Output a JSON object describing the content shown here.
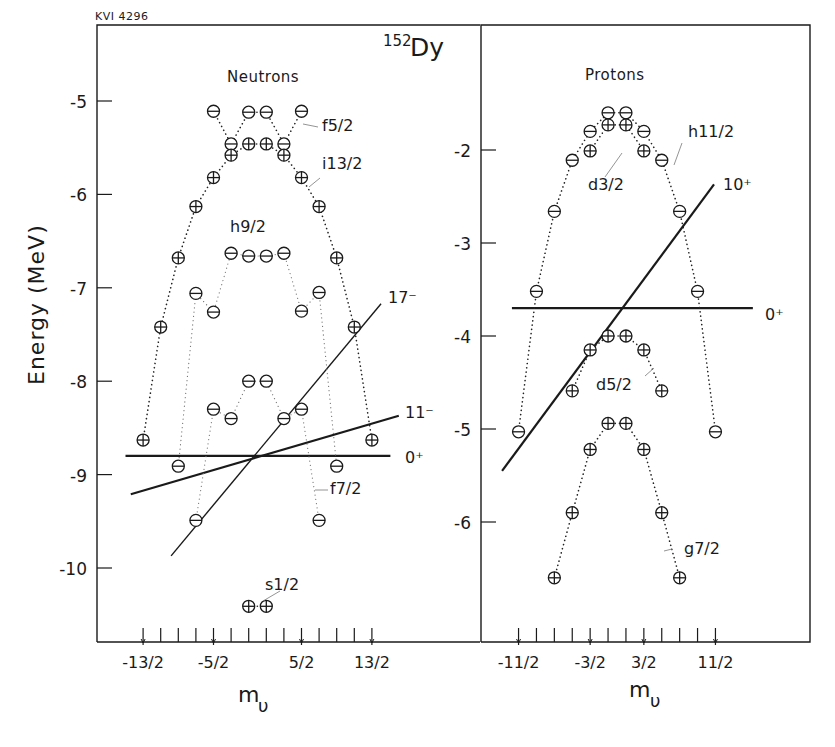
{
  "figure_id": "KVI 4296",
  "nucleus": {
    "mass_number": "152",
    "symbol": "Dy"
  },
  "chart_data": [
    {
      "type": "scatter",
      "title": "Neutrons",
      "xlabel": "m_ν",
      "ylabel": "Energy (MeV)",
      "ylim": [
        -10.8,
        -4.6
      ],
      "xlim": [
        -9,
        9
      ],
      "yticks": [
        -5,
        -6,
        -7,
        -8,
        -9,
        -10
      ],
      "ytick_labels": [
        "-5",
        "-6",
        "-7",
        "-8",
        "-9",
        "-10"
      ],
      "xticks": [
        -6.5,
        -5.5,
        -4.5,
        -3.5,
        -2.5,
        -1.5,
        -0.5,
        0.5,
        1.5,
        2.5,
        3.5,
        4.5,
        5.5,
        6.5
      ],
      "xtick_labels": [
        {
          "x": -6.5,
          "label": "-13/2"
        },
        {
          "x": -2.5,
          "label": "-5/2"
        },
        {
          "x": 2.5,
          "label": "5/2"
        },
        {
          "x": 6.5,
          "label": "13/2"
        }
      ],
      "major_xticks": [
        -6.5,
        -2.5,
        2.5,
        6.5
      ],
      "marker_legend": {
        "plus": "positive parity (⊕)",
        "minus": "negative parity (⊖)"
      },
      "series": [
        {
          "name": "f5/2",
          "parity": "minus",
          "label": "f5/2",
          "points": [
            [
              -2.5,
              -5.11
            ],
            [
              -1.5,
              -5.46
            ],
            [
              -0.5,
              -5.12
            ],
            [
              0.5,
              -5.12
            ],
            [
              1.5,
              -5.46
            ],
            [
              2.5,
              -5.11
            ]
          ],
          "line_order": [
            [
              -2.5,
              -5.11
            ],
            [
              -1.5,
              -5.46
            ],
            [
              -0.5,
              -5.12
            ]
          ],
          "line_order2": [
            [
              0.5,
              -5.12
            ],
            [
              1.5,
              -5.46
            ],
            [
              2.5,
              -5.11
            ]
          ]
        },
        {
          "name": "i13/2",
          "parity": "plus",
          "label": "i13/2",
          "points": [
            [
              -6.5,
              -8.63
            ],
            [
              -5.5,
              -7.42
            ],
            [
              -4.5,
              -6.68
            ],
            [
              -3.5,
              -6.13
            ],
            [
              -2.5,
              -5.82
            ],
            [
              -1.5,
              -5.58
            ],
            [
              -0.5,
              -5.46
            ],
            [
              0.5,
              -5.46
            ],
            [
              1.5,
              -5.58
            ],
            [
              2.5,
              -5.82
            ],
            [
              3.5,
              -6.13
            ],
            [
              4.5,
              -6.68
            ],
            [
              5.5,
              -7.42
            ],
            [
              6.5,
              -8.63
            ]
          ]
        },
        {
          "name": "h9/2",
          "parity": "minus",
          "label": "h9/2",
          "points": [
            [
              -4.5,
              -8.91
            ],
            [
              -3.5,
              -7.06
            ],
            [
              -2.5,
              -7.26
            ],
            [
              -1.5,
              -6.63
            ],
            [
              -0.5,
              -6.66
            ],
            [
              0.5,
              -6.66
            ],
            [
              1.5,
              -6.63
            ],
            [
              2.5,
              -7.25
            ],
            [
              3.5,
              -7.05
            ],
            [
              4.5,
              -8.91
            ]
          ]
        },
        {
          "name": "f7/2",
          "parity": "minus",
          "label": "f7/2",
          "points": [
            [
              -3.5,
              -9.49
            ],
            [
              -2.5,
              -8.3
            ],
            [
              -1.5,
              -8.4
            ],
            [
              -0.5,
              -8.0
            ],
            [
              0.5,
              -8.0
            ],
            [
              1.5,
              -8.4
            ],
            [
              2.5,
              -8.3
            ],
            [
              3.5,
              -9.49
            ]
          ]
        },
        {
          "name": "s1/2",
          "parity": "plus",
          "label": "s1/2",
          "points": [
            [
              -0.5,
              -10.41
            ],
            [
              0.5,
              -10.41
            ]
          ]
        }
      ],
      "bands": [
        {
          "label": "0⁺",
          "from": [
            -7.5,
            -8.8
          ],
          "to": [
            7.55,
            -8.8
          ],
          "weight": "heavy"
        },
        {
          "label": "11⁻",
          "from": [
            -7.2,
            -9.21
          ],
          "to": [
            8.03,
            -8.37
          ],
          "weight": "heavy"
        },
        {
          "label": "17⁻",
          "from": [
            -4.91,
            -9.87
          ],
          "to": [
            7.02,
            -7.17
          ],
          "weight": "thin"
        }
      ]
    },
    {
      "type": "scatter",
      "title": "Protons",
      "xlabel": "m_ν",
      "ylabel": "Energy (MeV)",
      "ylim": [
        -6.9,
        -1.2
      ],
      "xlim": [
        -7.5,
        10.5
      ],
      "yticks": [
        -2,
        -3,
        -4,
        -5,
        -6
      ],
      "ytick_labels": [
        "-2",
        "-3",
        "-4",
        "-5",
        "-6"
      ],
      "xticks": [
        -5.5,
        -4.5,
        -3.5,
        -2.5,
        -1.5,
        -0.5,
        0.5,
        1.5,
        2.5,
        3.5,
        4.5,
        5.5
      ],
      "xtick_labels": [
        {
          "x": -5.5,
          "label": "-11/2"
        },
        {
          "x": -1.5,
          "label": "-3/2"
        },
        {
          "x": 1.5,
          "label": "3/2"
        },
        {
          "x": 5.5,
          "label": "11/2"
        }
      ],
      "major_xticks": [
        -5.5,
        -1.5,
        1.5,
        5.5
      ],
      "series": [
        {
          "name": "h11/2",
          "parity": "minus",
          "label": "h11/2",
          "points": [
            [
              -5.5,
              -5.03
            ],
            [
              -4.5,
              -3.52
            ],
            [
              -3.5,
              -2.66
            ],
            [
              -2.5,
              -2.11
            ],
            [
              -1.5,
              -1.8
            ],
            [
              -0.5,
              -1.6
            ],
            [
              0.5,
              -1.6
            ],
            [
              1.5,
              -1.8
            ],
            [
              2.5,
              -2.11
            ],
            [
              3.5,
              -2.66
            ],
            [
              4.5,
              -3.52
            ],
            [
              5.5,
              -5.03
            ]
          ]
        },
        {
          "name": "d3/2",
          "parity": "plus",
          "label": "d3/2",
          "points": [
            [
              -1.5,
              -2.01
            ],
            [
              -0.5,
              -1.73
            ],
            [
              0.5,
              -1.73
            ],
            [
              1.5,
              -2.01
            ]
          ]
        },
        {
          "name": "d5/2",
          "parity": "plus",
          "label": "d5/2",
          "points": [
            [
              -2.5,
              -4.59
            ],
            [
              -1.5,
              -4.15
            ],
            [
              -0.5,
              -4.0
            ],
            [
              0.5,
              -4.0
            ],
            [
              1.5,
              -4.15
            ],
            [
              2.5,
              -4.59
            ]
          ]
        },
        {
          "name": "g7/2",
          "parity": "plus",
          "label": "g7/2",
          "points": [
            [
              -3.5,
              -6.6
            ],
            [
              -2.5,
              -5.9
            ],
            [
              -1.5,
              -5.22
            ],
            [
              -0.5,
              -4.94
            ],
            [
              0.5,
              -4.94
            ],
            [
              1.5,
              -5.22
            ],
            [
              2.5,
              -5.9
            ],
            [
              3.5,
              -6.6
            ]
          ]
        }
      ],
      "bands": [
        {
          "label": "0⁺",
          "from": [
            -5.87,
            -3.7
          ],
          "to": [
            7.59,
            -3.7
          ],
          "weight": "heavy"
        },
        {
          "label": "10⁺",
          "from": [
            -6.42,
            -5.45
          ],
          "to": [
            5.42,
            -2.37
          ],
          "weight": "heavy"
        }
      ]
    }
  ],
  "labels": {
    "neutrons_title": "Neutrons",
    "protons_title": "Protons",
    "ylabel": "Energy (MeV)",
    "xlabel_main": "m",
    "xlabel_sub": "υ"
  }
}
